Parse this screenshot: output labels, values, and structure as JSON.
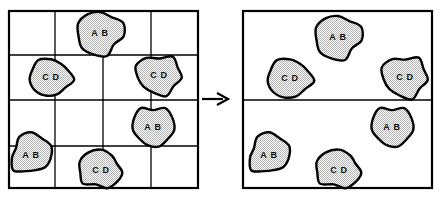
{
  "figure": {
    "background_color": "#ffffff",
    "line_color": "#000000",
    "blob_fill_color": "#d8d8d8",
    "blob_outline_color": "#000000",
    "label_color": "#111111"
  },
  "arrow": {
    "glyph": "→",
    "x": 202,
    "y": 99,
    "length": 26
  },
  "left_panel": {
    "name": "before-panel",
    "frame": {
      "x": 9,
      "y": 11,
      "width": 189,
      "height": 177
    },
    "grid": {
      "vertical_lines": [
        55,
        103,
        151
      ],
      "horizontal_lines": [
        55,
        100,
        146
      ],
      "columns": 4,
      "rows": 4
    },
    "blobs": [
      {
        "label": "A B",
        "cx": 100,
        "cy": 33,
        "rx": 22,
        "ry": 21,
        "seed": 1
      },
      {
        "label": "C D",
        "cx": 51,
        "cy": 77,
        "rx": 22,
        "ry": 19,
        "seed": 2
      },
      {
        "label": "C D",
        "cx": 159,
        "cy": 75,
        "rx": 22,
        "ry": 19,
        "seed": 3
      },
      {
        "label": "A B",
        "cx": 153,
        "cy": 127,
        "rx": 21,
        "ry": 21,
        "seed": 4
      },
      {
        "label": "A B",
        "cx": 31,
        "cy": 155,
        "rx": 20,
        "ry": 20,
        "seed": 5
      },
      {
        "label": "C D",
        "cx": 101,
        "cy": 170,
        "rx": 22,
        "ry": 19,
        "seed": 6
      }
    ]
  },
  "right_panel": {
    "name": "after-panel",
    "frame": {
      "x": 243,
      "y": 11,
      "width": 189,
      "height": 177
    },
    "grid": {
      "vertical_lines": [],
      "horizontal_lines": [
        100
      ],
      "columns": 1,
      "rows": 2
    },
    "blobs": [
      {
        "label": "A B",
        "cx": 338,
        "cy": 37,
        "rx": 22,
        "ry": 21,
        "seed": 1
      },
      {
        "label": "C D",
        "cx": 290,
        "cy": 78,
        "rx": 23,
        "ry": 20,
        "seed": 2
      },
      {
        "label": "C D",
        "cx": 405,
        "cy": 77,
        "rx": 22,
        "ry": 20,
        "seed": 3
      },
      {
        "label": "A B",
        "cx": 392,
        "cy": 127,
        "rx": 21,
        "ry": 21,
        "seed": 4
      },
      {
        "label": "A B",
        "cx": 269,
        "cy": 155,
        "rx": 20,
        "ry": 20,
        "seed": 5
      },
      {
        "label": "C D",
        "cx": 339,
        "cy": 170,
        "rx": 23,
        "ry": 19,
        "seed": 6
      }
    ]
  }
}
